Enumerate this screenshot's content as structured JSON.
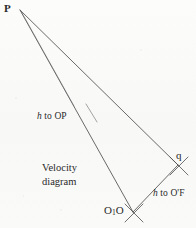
{
  "figure": {
    "kind": "velocity-diagram",
    "caption_line_1": "Velocity",
    "caption_line_2": "diagram",
    "background_color": "#fbfbfa",
    "ink_color": "#4a4a4a",
    "text_color": "#2a2a2a"
  },
  "labels": {
    "apex": "P",
    "vector_tip": "q",
    "origin": "O",
    "origin_subscript": "1",
    "origin_second": "O",
    "annotation_left_prefix": "h",
    "annotation_left_body": " to OP",
    "annotation_right_prefix": "h",
    "annotation_right_body": " to O'F"
  },
  "geometry": {
    "points": {
      "P": [
        20,
        10
      ],
      "q": [
        178,
        165
      ],
      "O1O": [
        133,
        212
      ]
    },
    "edges": [
      {
        "name": "P-to-q",
        "from": "P",
        "to": "q"
      },
      {
        "name": "P-to-O1O",
        "from": "P",
        "to": "O1O"
      },
      {
        "name": "q-to-O1O",
        "from": "q",
        "to": "O1O"
      }
    ],
    "tick_marks": [
      {
        "name": "tick-at-q",
        "at": [
          178,
          165
        ]
      },
      {
        "name": "tick-at-O1O",
        "at": [
          133,
          212
        ]
      }
    ]
  }
}
